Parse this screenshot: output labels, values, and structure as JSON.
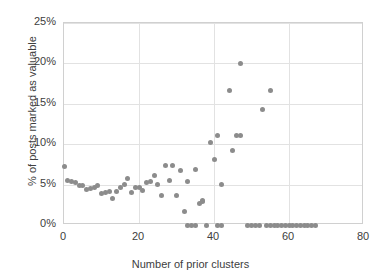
{
  "chart_data": {
    "type": "scatter",
    "title": "",
    "xlabel": "Number of prior clusters",
    "ylabel": "% of posts marked as valuable",
    "xlim": [
      0,
      80
    ],
    "ylim": [
      0,
      25
    ],
    "xticks": [
      "0",
      "20",
      "40",
      "60",
      "80"
    ],
    "xtick_values": [
      0,
      20,
      40,
      60,
      80
    ],
    "yticks": [
      "0%",
      "5%",
      "10%",
      "15%",
      "20%",
      "25%"
    ],
    "ytick_values": [
      0,
      5,
      10,
      15,
      20,
      25
    ],
    "grid": "horizontal-and-vertical",
    "legend": "none",
    "marker_color": "#8c8c8c",
    "marker_size": 5,
    "series": [
      {
        "name": "posts marked as valuable",
        "points": [
          [
            0,
            7.3
          ],
          [
            1,
            5.5
          ],
          [
            2,
            5.4
          ],
          [
            3,
            5.2
          ],
          [
            4,
            4.9
          ],
          [
            5,
            4.9
          ],
          [
            6,
            4.4
          ],
          [
            7,
            4.5
          ],
          [
            8,
            4.7
          ],
          [
            9,
            4.9
          ],
          [
            10,
            3.9
          ],
          [
            11,
            4.0
          ],
          [
            12,
            4.1
          ],
          [
            13,
            3.3
          ],
          [
            14,
            4.2
          ],
          [
            15,
            4.6
          ],
          [
            16,
            5.0
          ],
          [
            17,
            5.7
          ],
          [
            18,
            4.0
          ],
          [
            19,
            4.7
          ],
          [
            20,
            4.6
          ],
          [
            21,
            4.3
          ],
          [
            22,
            5.3
          ],
          [
            23,
            5.4
          ],
          [
            24,
            6.1
          ],
          [
            25,
            5.0
          ],
          [
            26,
            3.6
          ],
          [
            27,
            7.4
          ],
          [
            28,
            5.5
          ],
          [
            29,
            7.4
          ],
          [
            30,
            3.6
          ],
          [
            31,
            6.7
          ],
          [
            32,
            1.7
          ],
          [
            33,
            5.4
          ],
          [
            33,
            0.0
          ],
          [
            34,
            0.0
          ],
          [
            35,
            6.9
          ],
          [
            35,
            0.0
          ],
          [
            36,
            2.7
          ],
          [
            37,
            2.9
          ],
          [
            37,
            3.0
          ],
          [
            38,
            0.0
          ],
          [
            39,
            10.2
          ],
          [
            40,
            8.1
          ],
          [
            41,
            11.1
          ],
          [
            41,
            0.0
          ],
          [
            42,
            5.0
          ],
          [
            42,
            0.0
          ],
          [
            44,
            16.6
          ],
          [
            45,
            9.2
          ],
          [
            46,
            11.1
          ],
          [
            47,
            11.1
          ],
          [
            47,
            20.0
          ],
          [
            49,
            0.0
          ],
          [
            50,
            0.0
          ],
          [
            51,
            0.0
          ],
          [
            52,
            0.0
          ],
          [
            53,
            14.3
          ],
          [
            54,
            0.0
          ],
          [
            55,
            16.6
          ],
          [
            55,
            0.0
          ],
          [
            56,
            0.0
          ],
          [
            57,
            0.0
          ],
          [
            58,
            0.0
          ],
          [
            59,
            0.0
          ],
          [
            60,
            0.0
          ],
          [
            61,
            0.0
          ],
          [
            62,
            0.0
          ],
          [
            63,
            0.0
          ],
          [
            64,
            0.0
          ],
          [
            65,
            0.0
          ],
          [
            66,
            0.0
          ],
          [
            67,
            0.0
          ]
        ]
      }
    ]
  }
}
